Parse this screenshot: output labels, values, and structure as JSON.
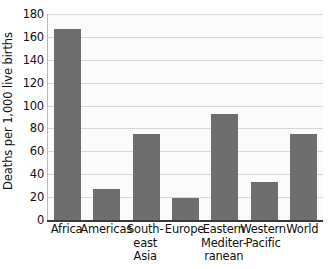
{
  "chart_data": {
    "type": "bar",
    "title": "",
    "xlabel": "",
    "ylabel": "Deaths per 1,000 live births",
    "ylim": [
      0,
      180
    ],
    "ytick_values": [
      180,
      160,
      140,
      120,
      100,
      80,
      60,
      40,
      20,
      0
    ],
    "ytick_labels": [
      "180",
      "160",
      "140",
      "120",
      "100",
      "80",
      "60",
      "40",
      "20",
      "0"
    ],
    "grid": true,
    "legend": "none",
    "bar_color": "#6e6e6e",
    "plot_background": "#fbfbfb",
    "gridline_color": "#d8d8d8",
    "axis_color": "#3a3a3a",
    "categories": [
      "Africa",
      "Americas",
      "South-east Asia",
      "Europe",
      "Eastern Mediterranean",
      "Western Pacific",
      "World"
    ],
    "category_label_lines": [
      [
        "Africa"
      ],
      [
        "Americas"
      ],
      [
        "South-",
        "east",
        "Asia"
      ],
      [
        "Europe"
      ],
      [
        "Eastern",
        "Mediter-",
        "ranean"
      ],
      [
        "Western",
        "Pacific"
      ],
      [
        "World"
      ]
    ],
    "values": [
      167,
      27,
      75,
      19,
      93,
      33,
      75
    ]
  }
}
